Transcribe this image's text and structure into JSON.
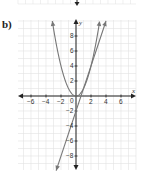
{
  "part_label": "b)",
  "colors": {
    "grid": "#e3e3e3",
    "axis": "#222222",
    "curve": "#777777"
  },
  "chart_data": {
    "type": "line",
    "title": "",
    "xlabel": "x",
    "ylabel": "y",
    "xlim": [
      -8,
      8
    ],
    "ylim": [
      -10,
      10
    ],
    "grid": true,
    "x_ticks": [
      -6,
      -4,
      -2,
      2,
      4,
      6
    ],
    "y_ticks": [
      8,
      6,
      4,
      2,
      -2,
      -4,
      -6,
      -8
    ],
    "origin_label": "0",
    "series": [
      {
        "name": "parabola",
        "equation": "y = x^2",
        "x": [
          -3,
          -2,
          -1,
          0,
          1,
          2,
          3
        ],
        "values": [
          9,
          4,
          1,
          0,
          1,
          4,
          9
        ]
      },
      {
        "name": "line",
        "equation": "y = 3x - 2",
        "x": [
          -2.5,
          0,
          4
        ],
        "values": [
          -9.5,
          -2,
          10
        ]
      }
    ]
  },
  "labels": {
    "x_axis": "x",
    "y_axis": "y",
    "origin": "0",
    "x_ticks": [
      "−6",
      "−4",
      "−2",
      "2",
      "4",
      "6"
    ],
    "y_ticks": [
      "8",
      "6",
      "4",
      "2",
      "−2",
      "−4",
      "−6",
      "−8"
    ]
  }
}
